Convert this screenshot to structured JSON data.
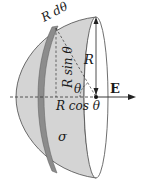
{
  "diagram": {
    "title": "",
    "labels": {
      "ring_width": "R dθ",
      "radius_vertical": "R",
      "ring_radius": "R sin θ",
      "angle": "θ",
      "axial_distance": "R cos θ",
      "field": "E",
      "surface_charge": "σ"
    },
    "colors": {
      "shell_fill": "#d4d4d4",
      "band_fill": "#8c8c8c",
      "outline": "#4a4a4a",
      "opening_fill": "#ffffff",
      "text": "#1a1a1a"
    }
  }
}
